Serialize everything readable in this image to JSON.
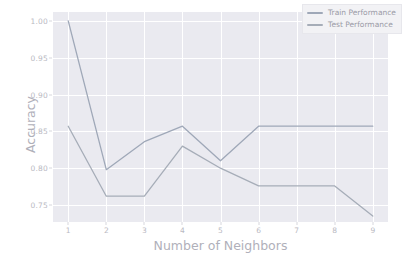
{
  "chart_data": {
    "type": "line",
    "title": "",
    "xlabel": "Number of Neighbors",
    "ylabel": "Accuracy",
    "x": [
      1,
      2,
      3,
      4,
      5,
      6,
      7,
      8,
      9
    ],
    "xtick_labels": [
      "1",
      "2",
      "3",
      "4",
      "5",
      "6",
      "7",
      "8",
      "9"
    ],
    "ytick_labels": [
      "1.00",
      "0.95",
      "0.90",
      "0.85",
      "0.80",
      "0.75"
    ],
    "ytick_values": [
      1.0,
      0.95,
      0.9,
      0.85,
      0.8,
      0.75
    ],
    "xlim": [
      0.6,
      9.4
    ],
    "ylim": [
      0.727,
      1.012
    ],
    "grid": true,
    "legend_position": "upper right",
    "series": [
      {
        "name": "Train Performance",
        "color": "#9fa8b8",
        "values": [
          1.0,
          0.798,
          0.836,
          0.857,
          0.81,
          0.857,
          0.857,
          0.857,
          0.857
        ]
      },
      {
        "name": "Test Performance",
        "color": "#a6adb8",
        "values": [
          0.857,
          0.762,
          0.762,
          0.83,
          0.8,
          0.776,
          0.776,
          0.776,
          0.735
        ]
      }
    ],
    "background_color": "#eaeaf0",
    "gridline_color": "#ffffff",
    "tick_label_color": "#b9b9c2",
    "axis_label_color": "#b0b0ba"
  }
}
